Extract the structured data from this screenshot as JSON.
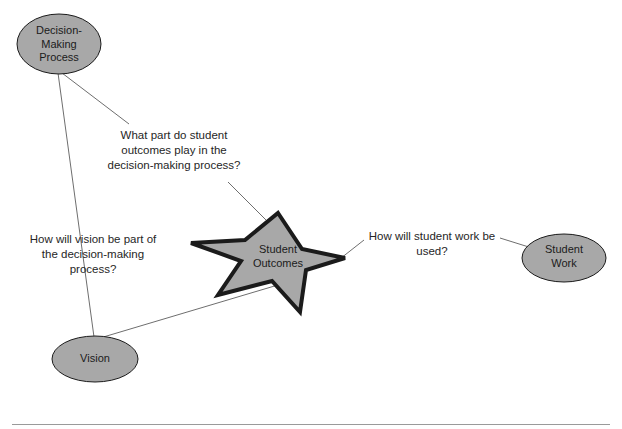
{
  "diagram": {
    "type": "concept-map",
    "colors": {
      "shape_fill": "#a8a8a8",
      "shape_stroke": "#1b1b1b",
      "connector": "#6e6e6e",
      "text": "#1b1b1b",
      "background": "#ffffff",
      "rule": "#9a9a9a"
    },
    "nodes": [
      {
        "id": "decision-making-process",
        "shape": "ellipse",
        "label": "Decision-\nMaking\nProcess",
        "cx": 59,
        "cy": 44,
        "rx": 42,
        "ry": 30
      },
      {
        "id": "student-outcomes",
        "shape": "star",
        "label": "Student\nOutcomes",
        "cx": 268,
        "cy": 262
      },
      {
        "id": "vision",
        "shape": "ellipse",
        "label": "Vision",
        "cx": 95,
        "cy": 359,
        "rx": 43,
        "ry": 23
      },
      {
        "id": "student-work",
        "shape": "ellipse",
        "label": "Student\nWork",
        "cx": 564,
        "cy": 258,
        "rx": 42,
        "ry": 24
      }
    ],
    "annotations": [
      {
        "id": "decision-outcomes",
        "text": "What part do student\noutcomes play in the\ndecision-making process?",
        "connects": [
          "decision-making-process",
          "student-outcomes"
        ]
      },
      {
        "id": "vision-decision",
        "text": "How will vision be part of\nthe decision-making\nprocess?",
        "connects": [
          "decision-making-process",
          "vision"
        ]
      },
      {
        "id": "student-work-used",
        "text": "How will student work be\nused?",
        "connects": [
          "student-outcomes",
          "student-work"
        ]
      }
    ],
    "edges": [
      {
        "id": "edge-decision-to-outcomes-upper",
        "from": "decision-making-process",
        "to": "annotation-decision-outcomes"
      },
      {
        "id": "edge-outcomes-to-annotation-lower",
        "from": "annotation-decision-outcomes",
        "to": "student-outcomes"
      },
      {
        "id": "edge-decision-to-vision",
        "from": "decision-making-process",
        "to": "vision"
      },
      {
        "id": "edge-vision-to-outcomes",
        "from": "vision",
        "to": "student-outcomes"
      },
      {
        "id": "edge-outcomes-to-work-annotation",
        "from": "student-outcomes",
        "to": "annotation-student-work-used"
      },
      {
        "id": "edge-work-annotation-to-work",
        "from": "annotation-student-work-used",
        "to": "student-work"
      }
    ]
  }
}
